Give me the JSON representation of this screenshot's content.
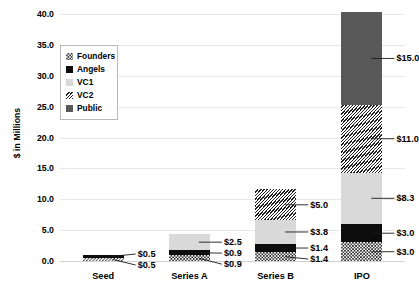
{
  "chart_data": {
    "type": "bar",
    "subtype": "stacked",
    "title": "",
    "xlabel": "",
    "ylabel": "$ in Millions",
    "categories": [
      "Seed",
      "Series A",
      "Series B",
      "IPO"
    ],
    "ylim": [
      0,
      40
    ],
    "ytick_step": 5,
    "ytick_labels": [
      "0.0",
      "5.0",
      "10.0",
      "15.0",
      "20.0",
      "25.0",
      "30.0",
      "35.0",
      "40.0"
    ],
    "ytick_values": [
      0,
      5,
      10,
      15,
      20,
      25,
      30,
      35,
      40
    ],
    "grid": true,
    "legend_position": "upper-left-inside",
    "series": [
      {
        "name": "Founders",
        "fill": "dotted-checker",
        "color": "#ffffff",
        "values": [
          0.5,
          0.9,
          1.4,
          3.0
        ],
        "labels": [
          "$0.5",
          "$0.9",
          "$1.4",
          "$3.0"
        ]
      },
      {
        "name": "Angels",
        "fill": "solid",
        "color": "#0d0d0d",
        "values": [
          0.5,
          0.9,
          1.4,
          3.0
        ],
        "labels": [
          "$0.5",
          "$0.9",
          "$1.4",
          "$3.0"
        ]
      },
      {
        "name": "VC1",
        "fill": "solid",
        "color": "#d9d9d9",
        "values": [
          0,
          2.5,
          3.8,
          8.3
        ],
        "labels": [
          "",
          "$2.5",
          "$3.8",
          "$8.3"
        ]
      },
      {
        "name": "VC2",
        "fill": "diagonal-hatch",
        "color": "#ffffff",
        "values": [
          0,
          0,
          5.0,
          11.0
        ],
        "labels": [
          "",
          "",
          "$5.0",
          "$11.0"
        ]
      },
      {
        "name": "Public",
        "fill": "solid",
        "color": "#595959",
        "values": [
          0,
          0,
          0,
          15.0
        ],
        "labels": [
          "",
          "",
          "",
          "$15.0"
        ]
      }
    ]
  },
  "legend": {
    "items": [
      {
        "label": "Founders",
        "swatch": "founders-swatch"
      },
      {
        "label": "Angels",
        "swatch": "angels-swatch"
      },
      {
        "label": "VC1",
        "swatch": "vc1-swatch"
      },
      {
        "label": "VC2",
        "swatch": "vc2-swatch"
      },
      {
        "label": "Public",
        "swatch": "public-swatch"
      }
    ]
  }
}
